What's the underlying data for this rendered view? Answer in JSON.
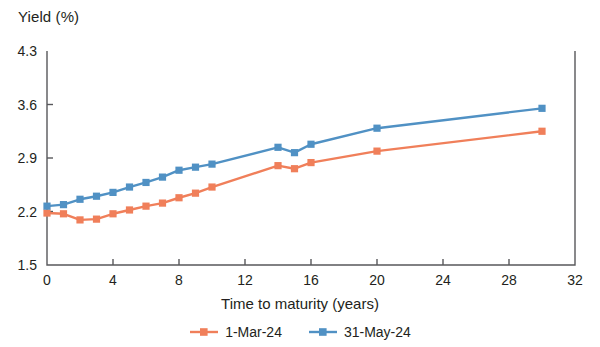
{
  "chart_data": {
    "type": "line",
    "title": "",
    "ylabel": "Yield (%)",
    "xlabel": "Time to maturity (years)",
    "xlim": [
      0,
      32
    ],
    "ylim": [
      1.5,
      4.3
    ],
    "xticks": [
      0,
      4,
      8,
      12,
      16,
      20,
      24,
      28,
      32
    ],
    "yticks": [
      1.5,
      2.2,
      2.9,
      3.6,
      4.3
    ],
    "xtick_labels": [
      "0",
      "4",
      "8",
      "12",
      "16",
      "20",
      "24",
      "28",
      "32"
    ],
    "ytick_labels": [
      "1.5",
      "2.2",
      "2.9",
      "3.6",
      "4.3"
    ],
    "grid": false,
    "legend_position": "bottom",
    "marker": "square",
    "x": [
      0,
      1,
      2,
      3,
      4,
      5,
      6,
      7,
      8,
      9,
      10,
      14,
      15,
      16,
      20,
      30
    ],
    "series": [
      {
        "name": "1-Mar-24",
        "color": "#f07f5a",
        "values": [
          2.18,
          2.17,
          2.09,
          2.1,
          2.17,
          2.22,
          2.27,
          2.31,
          2.38,
          2.44,
          2.52,
          2.8,
          2.76,
          2.84,
          2.99,
          3.25
        ]
      },
      {
        "name": "31-May-24",
        "color": "#5091c4",
        "values": [
          2.27,
          2.29,
          2.36,
          2.4,
          2.45,
          2.52,
          2.58,
          2.65,
          2.74,
          2.78,
          2.82,
          3.04,
          2.97,
          3.08,
          3.29,
          3.55
        ]
      }
    ]
  },
  "legend": {
    "entries": [
      {
        "label": "1-Mar-24",
        "color": "#f07f5a"
      },
      {
        "label": "31-May-24",
        "color": "#5091c4"
      }
    ]
  }
}
